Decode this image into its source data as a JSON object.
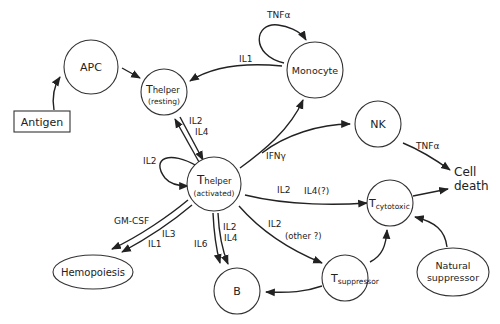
{
  "diagram": {
    "type": "cytokine-network",
    "nodes": {
      "antigen": {
        "label": "Antigen",
        "shape": "rect"
      },
      "apc": {
        "label": "APC",
        "shape": "circle"
      },
      "thelper_resting": {
        "main": "T",
        "sub": "helper",
        "state": "(resting)",
        "shape": "circle"
      },
      "monocyte": {
        "label": "Monocyte",
        "shape": "circle"
      },
      "nk": {
        "label": "NK",
        "shape": "circle"
      },
      "thelper_activated": {
        "main": "T",
        "sub": "helper",
        "state": "(activated)",
        "shape": "circle"
      },
      "tcytotoxic": {
        "main": "T",
        "sub": "cytotoxic",
        "shape": "circle"
      },
      "cell_death": {
        "line1": "Cell",
        "line2": "death",
        "shape": "text"
      },
      "hemopoiesis": {
        "label": "Hemopoiesis",
        "shape": "ellipse"
      },
      "b": {
        "label": "B",
        "shape": "circle"
      },
      "tsuppressor": {
        "main": "T",
        "sub": "suppressor",
        "shape": "circle"
      },
      "natural_suppressor": {
        "line1": "Natural",
        "line2": "suppressor",
        "shape": "ellipse"
      }
    },
    "edge_labels": {
      "monocyte_self": "TNFα",
      "monocyte_to_thelper": "IL1",
      "thelper_bidirectional_1": "IL2",
      "thelper_bidirectional_2": "IL4",
      "thelper_activated_self": "IL2",
      "ifn": "IFNγ",
      "nk_to_death": "TNFα",
      "to_cytotoxic_1": "IL2",
      "to_cytotoxic_2": "IL4(?)",
      "to_suppressor_1": "IL2",
      "to_suppressor_2": "(other ?)",
      "gmcsf": "GM-CSF",
      "il3": "IL3",
      "il1": "IL1",
      "il6": "IL6",
      "to_b_1": "IL2",
      "to_b_2": "IL4"
    },
    "edges": [
      {
        "from": "Antigen",
        "to": "APC"
      },
      {
        "from": "APC",
        "to": "Thelper (resting)"
      },
      {
        "from": "Monocyte",
        "to": "Thelper (resting)",
        "label": "IL1"
      },
      {
        "from": "Monocyte",
        "to": "Monocyte",
        "label": "TNFα"
      },
      {
        "from": "Thelper (resting)",
        "to": "Thelper (activated)",
        "label": "IL2 IL4",
        "bidirectional": true
      },
      {
        "from": "Thelper (activated)",
        "to": "Thelper (activated)",
        "label": "IL2"
      },
      {
        "from": "Thelper (activated)",
        "to": "Monocyte",
        "label": "IFNγ"
      },
      {
        "from": "Thelper (activated)",
        "to": "NK",
        "label": "IFNγ"
      },
      {
        "from": "NK",
        "to": "Cell death",
        "label": "TNFα"
      },
      {
        "from": "Thelper (activated)",
        "to": "Tcytotoxic",
        "label": "IL2 IL4(?)"
      },
      {
        "from": "Tcytotoxic",
        "to": "Cell death"
      },
      {
        "from": "Thelper (activated)",
        "to": "Tsuppressor",
        "label": "IL2 (other ?)"
      },
      {
        "from": "Tsuppressor",
        "to": "Tcytotoxic"
      },
      {
        "from": "Tsuppressor",
        "to": "B"
      },
      {
        "from": "Natural suppressor",
        "to": "Tcytotoxic"
      },
      {
        "from": "Thelper (activated)",
        "to": "Hemopoiesis",
        "label": "GM-CSF IL3 IL1"
      },
      {
        "from": "Thelper (activated)",
        "to": "B",
        "label": "IL6 IL2 IL4"
      }
    ]
  }
}
